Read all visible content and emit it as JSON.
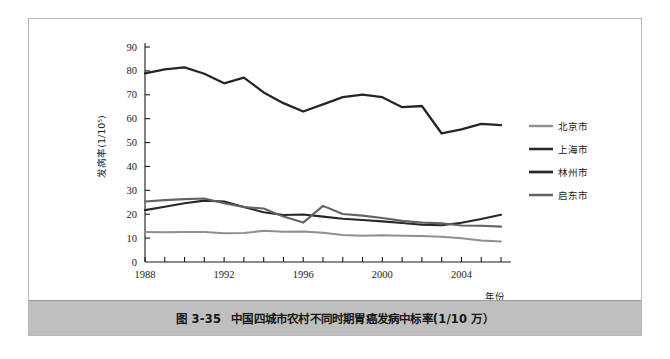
{
  "figure": {
    "caption_number": "图 3-35",
    "caption_title": "中国四城市农村不同时期胃癌发病中标率(1/10 万）",
    "border_color": "#b8b8b8",
    "caption_bar_color": "#bfbfbf"
  },
  "chart_data": {
    "type": "line",
    "title": "",
    "subtitle": "",
    "xlabel": "年份",
    "ylabel": "发病率(1/10⁵)",
    "xlim": [
      1988,
      2006
    ],
    "ylim": [
      0,
      90
    ],
    "ytick_step": 10,
    "xtick_step": 1,
    "xtick_label_step": 4,
    "grid": false,
    "legend_position": "right",
    "ytick_labels": [
      "0",
      "10",
      "20",
      "30",
      "40",
      "50",
      "60",
      "70",
      "80",
      "90"
    ],
    "xtick_labels_shown": [
      "1988",
      "1992",
      "1996",
      "2000",
      "2004"
    ],
    "x": [
      1988,
      1989,
      1990,
      1991,
      1992,
      1993,
      1994,
      1995,
      1996,
      1997,
      1998,
      1999,
      2000,
      2001,
      2002,
      2003,
      2004,
      2005,
      2006
    ],
    "series": [
      {
        "name": "北京市",
        "color": "#8f8f8f",
        "width": 2.0,
        "values": [
          12.6,
          12.5,
          12.6,
          12.6,
          12.0,
          12.1,
          13.1,
          12.7,
          12.8,
          12.2,
          11.3,
          11.0,
          11.2,
          11.0,
          10.9,
          10.6,
          9.9,
          9.0,
          8.6
        ]
      },
      {
        "name": "上海市",
        "color": "#272727",
        "width": 2.1,
        "values": [
          21.7,
          23.1,
          24.6,
          25.7,
          25.3,
          23.0,
          20.8,
          19.7,
          19.9,
          19.0,
          18.1,
          17.6,
          17.0,
          16.3,
          15.6,
          15.4,
          16.4,
          18.0,
          19.8
        ]
      },
      {
        "name": "林州市",
        "color": "#262626",
        "width": 2.3,
        "values": [
          79.0,
          80.6,
          81.5,
          78.8,
          74.8,
          77.2,
          71.0,
          66.5,
          63.0,
          66.0,
          69.0,
          70.1,
          69.0,
          64.8,
          65.3,
          53.8,
          55.5,
          57.8,
          57.3
        ]
      },
      {
        "name": "启东市",
        "color": "#636363",
        "width": 2.1,
        "values": [
          25.3,
          25.9,
          26.3,
          26.6,
          24.6,
          23.0,
          22.4,
          19.0,
          16.5,
          23.5,
          20.1,
          19.4,
          18.4,
          17.2,
          16.5,
          16.2,
          15.3,
          15.2,
          14.8
        ]
      }
    ],
    "annotations": []
  },
  "legend": {
    "items": [
      {
        "label": "北京市"
      },
      {
        "label": "上海市"
      },
      {
        "label": "林州市"
      },
      {
        "label": "启东市"
      }
    ]
  }
}
